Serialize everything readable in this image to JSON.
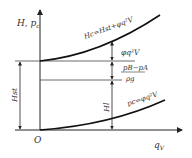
{
  "diagram": {
    "y_axis_label": "H, p",
    "y_axis_label_sub": "c",
    "x_axis_label": "q",
    "x_axis_label_sub": "V",
    "origin_label": "O",
    "upper_curve_label": "Hc=Hst+φq²V",
    "lower_curve_label": "pc=φq²V",
    "dim_left_label": "Hst",
    "dim_right_label": "Hl",
    "term_top": "φq²V",
    "fraction_numerator": "pB−pA",
    "fraction_denominator": "ρg",
    "colors": {
      "line": "#222222",
      "text": "#333333",
      "background": "#ffffff"
    }
  }
}
